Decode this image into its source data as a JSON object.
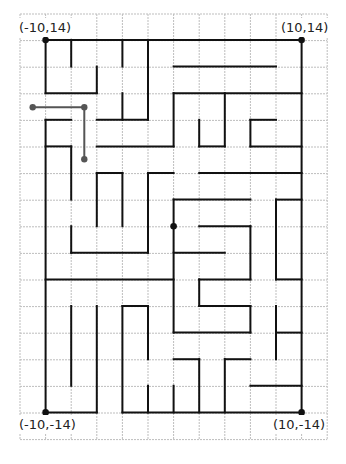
{
  "diagram": {
    "type": "maze",
    "grid": {
      "origin_x": 20,
      "origin_y": 14,
      "cell_w": 25.6,
      "cell_h": 26.6,
      "cols": 12,
      "rows": 16,
      "line_color": "#bdbdbd"
    },
    "maze": {
      "node_origin_x": 45.6,
      "node_origin_y": 40,
      "wall_color": "#111111",
      "wall_width": 2,
      "horizontal_walls": [
        [
          0,
          0,
          10
        ],
        [
          1,
          5,
          9
        ],
        [
          2,
          0,
          2
        ],
        [
          2,
          5,
          10
        ],
        [
          3,
          0,
          1
        ],
        [
          3,
          2,
          4
        ],
        [
          3,
          8,
          9
        ],
        [
          4,
          0,
          1
        ],
        [
          4,
          2,
          5
        ],
        [
          4,
          6,
          7
        ],
        [
          4,
          8,
          10
        ],
        [
          5,
          2,
          3
        ],
        [
          5,
          4,
          5
        ],
        [
          5,
          6,
          10
        ],
        [
          6,
          5,
          8
        ],
        [
          6,
          9,
          10
        ],
        [
          7,
          6,
          8
        ],
        [
          8,
          1,
          4
        ],
        [
          8,
          5,
          7
        ],
        [
          9,
          0,
          5
        ],
        [
          9,
          6,
          8
        ],
        [
          9,
          9,
          10
        ],
        [
          10,
          3,
          4
        ],
        [
          10,
          6,
          8
        ],
        [
          11,
          5,
          8
        ],
        [
          11,
          9,
          10
        ],
        [
          12,
          5,
          6
        ],
        [
          12,
          7,
          8
        ],
        [
          13,
          8,
          10
        ],
        [
          14,
          0,
          2
        ],
        [
          14,
          3,
          10
        ]
      ],
      "vertical_walls": [
        [
          0,
          0,
          2
        ],
        [
          0,
          3,
          14
        ],
        [
          1,
          0,
          1
        ],
        [
          1,
          4,
          6
        ],
        [
          1,
          7,
          8
        ],
        [
          1,
          10,
          13
        ],
        [
          2,
          1,
          2
        ],
        [
          2,
          5,
          7
        ],
        [
          2,
          10,
          14
        ],
        [
          3,
          0,
          1
        ],
        [
          3,
          2,
          3
        ],
        [
          3,
          5,
          7
        ],
        [
          3,
          10,
          14
        ],
        [
          4,
          0,
          3
        ],
        [
          4,
          5,
          8
        ],
        [
          4,
          10,
          12
        ],
        [
          4,
          13,
          14
        ],
        [
          5,
          2,
          4
        ],
        [
          5,
          6,
          11
        ],
        [
          5,
          13,
          14
        ],
        [
          6,
          3,
          4
        ],
        [
          6,
          9,
          10
        ],
        [
          6,
          12,
          14
        ],
        [
          7,
          2,
          4
        ],
        [
          7,
          12,
          14
        ],
        [
          8,
          3,
          4
        ],
        [
          8,
          7,
          9
        ],
        [
          8,
          10,
          11
        ],
        [
          9,
          6,
          9
        ],
        [
          9,
          10,
          12
        ],
        [
          10,
          0,
          14
        ]
      ],
      "corner_points": [
        {
          "label": "(-10,14)",
          "c": 0,
          "r": 0
        },
        {
          "label": "(10,14)",
          "c": 10,
          "r": 0
        },
        {
          "label": "(-10,-14)",
          "c": 0,
          "r": 14
        },
        {
          "label": "(10,-14)",
          "c": 10,
          "r": 14
        }
      ],
      "marker_point": {
        "c": 5,
        "r": 7
      },
      "path": {
        "color": "#555555",
        "points": [
          [
            32.7,
            107.3
          ],
          [
            84.3,
            107.3
          ],
          [
            84.3,
            159.3
          ]
        ]
      }
    },
    "labels": {
      "top_left": "(-10,14)",
      "top_right": "(10,14)",
      "bottom_left": "(-10,-14)",
      "bottom_right": "(10,-14)"
    }
  }
}
